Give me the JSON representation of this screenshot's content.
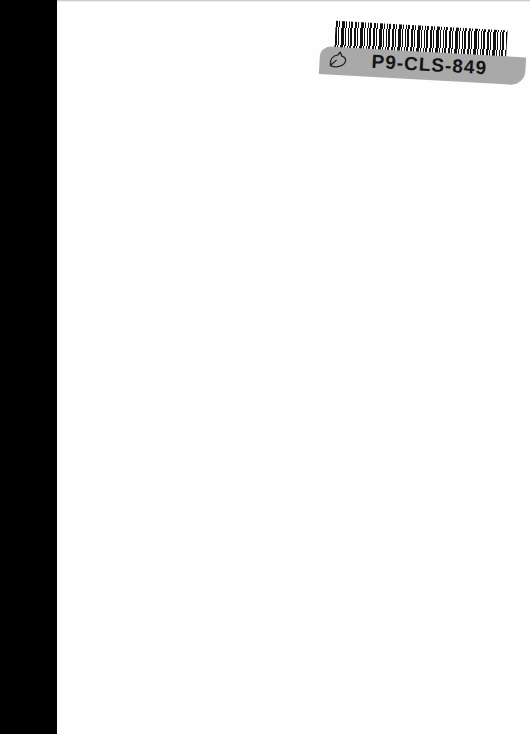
{
  "page": {
    "scan_edge_color": "#000000",
    "paper_color": "#fefefe"
  },
  "sticker": {
    "code": "P9-CLS-849",
    "band_color": "#a9a9a9",
    "icon": "leaf-outline-icon"
  }
}
